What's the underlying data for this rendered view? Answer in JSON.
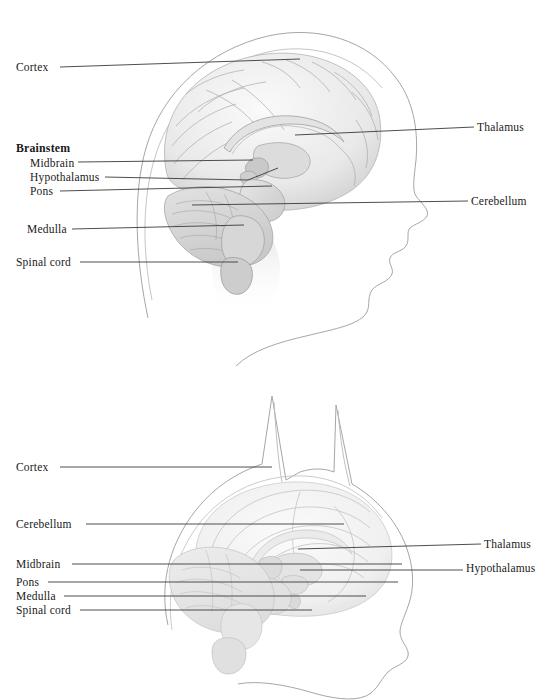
{
  "figure": {
    "background_color": "#ffffff",
    "line_color": "#3a3a3a",
    "outline_color": "#9a9a9a",
    "brain_fill": "#efefef",
    "brain_shade": "#d9d9d9",
    "text_color": "#1a1a1a"
  },
  "panels": [
    {
      "id": "human",
      "subject": "human-head-profile",
      "labels_left": [
        {
          "text": "Cortex",
          "bold": false,
          "x": 16,
          "y": 62,
          "line_from": 60,
          "line_to": 300,
          "line_y": 67,
          "line_y2": 59
        },
        {
          "text": "Brainstem",
          "bold": true,
          "x": 16,
          "y": 143,
          "line_from": null,
          "line_to": null
        },
        {
          "text": "Midbrain",
          "bold": false,
          "x": 30,
          "y": 158,
          "line_from": 78,
          "line_to": 253,
          "line_y": 162,
          "line_y2": 160
        },
        {
          "text": "Hypothalamus",
          "bold": false,
          "x": 30,
          "y": 172,
          "line_from": 105,
          "line_to": 262,
          "line_y": 177,
          "line_y2": 167
        },
        {
          "text": "Pons",
          "bold": false,
          "x": 30,
          "y": 186,
          "line_from": 60,
          "line_to": 272,
          "line_y": 191,
          "line_y2": 186
        },
        {
          "text": "Medulla",
          "bold": false,
          "x": 27,
          "y": 224,
          "line_from": 72,
          "line_to": 244,
          "line_y": 229,
          "line_y2": 225
        },
        {
          "text": "Spinal cord",
          "bold": false,
          "x": 16,
          "y": 257,
          "line_from": 80,
          "line_to": 238,
          "line_y": 262,
          "line_y2": 262
        }
      ],
      "labels_right": [
        {
          "text": "Thalamus",
          "x": 477,
          "y": 122,
          "line_from": 295,
          "line_to": 474,
          "line_y": 135,
          "line_y2": 127
        },
        {
          "text": "Cerebellum",
          "x": 471,
          "y": 196,
          "line_from": 192,
          "line_to": 468,
          "line_y": 205,
          "line_y2": 201
        }
      ]
    },
    {
      "id": "cat",
      "subject": "cat-head-profile",
      "labels_left": [
        {
          "text": "Cortex",
          "bold": false,
          "x": 16,
          "y": 462,
          "line_from": 60,
          "line_to": 272,
          "line_y": 467,
          "line_y2": 467
        },
        {
          "text": "Cerebellum",
          "bold": false,
          "x": 16,
          "y": 519,
          "line_from": 86,
          "line_to": 344,
          "line_y": 524,
          "line_y2": 524
        },
        {
          "text": "Midbrain",
          "bold": false,
          "x": 16,
          "y": 559,
          "line_from": 72,
          "line_to": 402,
          "line_y": 564,
          "line_y2": 564
        },
        {
          "text": "Pons",
          "bold": false,
          "x": 16,
          "y": 577,
          "line_from": 48,
          "line_to": 398,
          "line_y": 582,
          "line_y2": 582
        },
        {
          "text": "Medulla",
          "bold": false,
          "x": 16,
          "y": 591,
          "line_from": 64,
          "line_to": 366,
          "line_y": 596,
          "line_y2": 596
        },
        {
          "text": "Spinal cord",
          "bold": false,
          "x": 16,
          "y": 605,
          "line_from": 80,
          "line_to": 312,
          "line_y": 610,
          "line_y2": 610
        }
      ],
      "labels_right": [
        {
          "text": "Thalamus",
          "x": 484,
          "y": 539,
          "line_from": 298,
          "line_to": 481,
          "line_y": 549,
          "line_y2": 544
        },
        {
          "text": "Hypothalamus",
          "x": 466,
          "y": 563,
          "line_from": 300,
          "line_to": 463,
          "line_y": 570,
          "line_y2": 570
        }
      ]
    }
  ]
}
